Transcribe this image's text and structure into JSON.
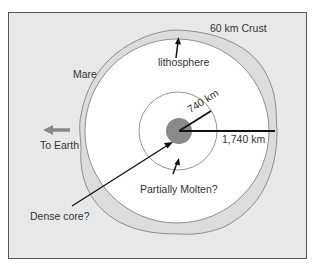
{
  "diagram": {
    "labels": {
      "crust": "60 km Crust",
      "lithosphere": "lithosphere",
      "mare": "Mare",
      "to_earth": "To Earth",
      "inner_radius": "740 km",
      "outer_radius": "1,740 km",
      "partially_molten": "Partially Molten?",
      "dense_core": "Dense core?"
    },
    "colors": {
      "background": "#e8e8e8",
      "crust": "#dcdcdc",
      "mantle": "#ffffff",
      "core": "#8a8a8a",
      "arrow_to_earth": "#888888",
      "lines": "#111111"
    },
    "layers": [
      {
        "name": "Crust",
        "thickness_km": 60
      },
      {
        "name": "Lithosphere / mantle",
        "radius_km": 1740
      },
      {
        "name": "Partially molten zone",
        "radius_km": 740
      },
      {
        "name": "Dense core",
        "note": "uncertain"
      }
    ]
  }
}
